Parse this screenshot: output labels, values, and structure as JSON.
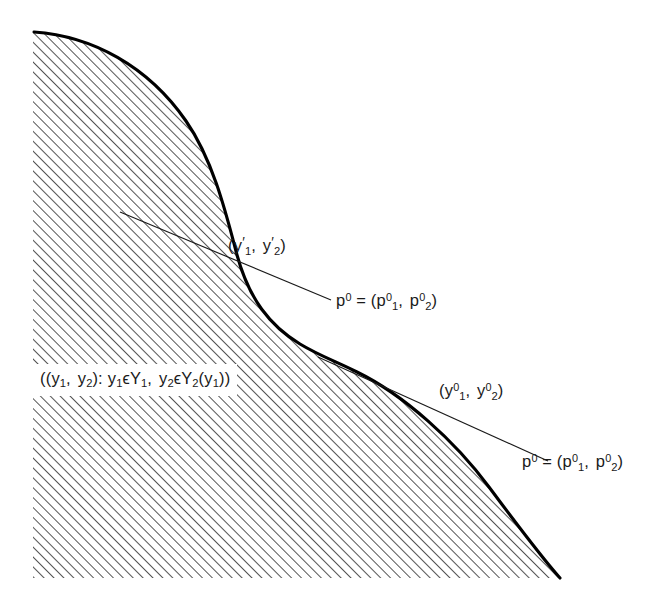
{
  "figure": {
    "kind": "production-possibility-set-diagram",
    "background_color": "#ffffff",
    "ink_color": "#1a1a1a",
    "hatch_color": "#555555",
    "boundary_color": "#000000"
  },
  "labels": {
    "set_definition": {
      "name": "production-set-definition",
      "open_outer": "(",
      "open_inner": "(",
      "y1": "y",
      "y1_sub": "1",
      "comma1": ", ",
      "y2": "y",
      "y2_sub": "2",
      "close_inner": ")",
      "colon": ": ",
      "y1b": "y",
      "y1b_sub": "1",
      "member1": "ϵ",
      "Y1": "Y",
      "Y1_sub": "1",
      "comma2": ", ",
      "y2b": "y",
      "y2b_sub": "2",
      "member2": "ϵ",
      "Y2": "Y",
      "Y2_sub": "2",
      "arg_open": "(",
      "arg_y1": "y",
      "arg_y1_sub": "1",
      "arg_close": ")",
      "close_outer": ")",
      "plain_text": "((y1 , y2) : y1 ϵ Y1 , y2 ϵ Y2 (y1))"
    },
    "y_prime_point": {
      "name": "y-prime-point-label",
      "open": "(",
      "y1": "y",
      "y1_prime": "′",
      "y1_sub": "1",
      "comma": ", ",
      "y2": "y",
      "y2_prime": "′",
      "y2_sub": "2",
      "close": ")",
      "plain_text": "(y′1 , y′2)"
    },
    "y_zero_point": {
      "name": "y-zero-point-label",
      "open": "(",
      "y1": "y",
      "y1_sup": "0",
      "y1_sub": "1",
      "comma": ", ",
      "y2": "y",
      "y2_sup": "0",
      "y2_sub": "2",
      "close": ")",
      "plain_text": "(y₀¹ , y₀²)"
    },
    "price_vector_upper": {
      "name": "price-vector-upper-label",
      "p": "p",
      "p_sup": "0",
      "equals": " = ",
      "open": "(",
      "p1": "p",
      "p1_sup": "0",
      "p1_sub": "1",
      "comma": ", ",
      "p2": "p",
      "p2_sup": "0",
      "p2_sub": "2",
      "close": ")",
      "plain_text": "p0 = (p01 , p02)"
    },
    "price_vector_lower": {
      "name": "price-vector-lower-label",
      "p": "p",
      "p_sup": "0",
      "equals": " = ",
      "open": "(",
      "p1": "p",
      "p1_sup": "0",
      "p1_sub": "1",
      "comma": ", ",
      "p2": "p",
      "p2_sup": "0",
      "p2_sub": "2",
      "close": ")",
      "plain_text": "p0 = (p01 , p02)"
    }
  },
  "geometry": {
    "region": {
      "left_edge_x": 33,
      "bottom_edge_y": 578,
      "curve_start": [
        34,
        32
      ],
      "curve_end": [
        560,
        578
      ]
    },
    "tangent_upper": {
      "from": [
        120,
        212
      ],
      "to": [
        331,
        300
      ]
    },
    "tangent_lower": {
      "from": [
        318,
        357
      ],
      "to": [
        548,
        461
      ]
    },
    "hatch_angle_deg": 45,
    "hatch_spacing_px": 7
  }
}
